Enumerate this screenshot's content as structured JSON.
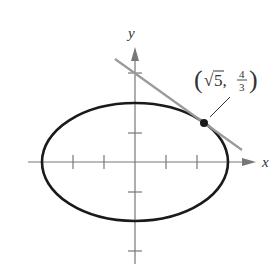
{
  "figure": {
    "type": "diagram",
    "axes": {
      "x_label": "x",
      "y_label": "y",
      "x_ticks": [
        -3,
        -2,
        -1,
        1,
        2,
        3
      ],
      "y_ticks": [
        -3,
        -2,
        -1,
        1,
        2,
        3
      ]
    },
    "ellipse": {
      "semi_major_x": 3,
      "semi_minor_y": 2,
      "color": "#1a1a1a"
    },
    "tangent_line": {
      "equation": "y = 3 - (sqrt5/3)x",
      "color": "#9a9a9a"
    },
    "point": {
      "label_open": "(",
      "label_sqrt": "√",
      "label_x": "5,",
      "label_num": "4",
      "label_den": "3",
      "label_close": ")"
    }
  }
}
